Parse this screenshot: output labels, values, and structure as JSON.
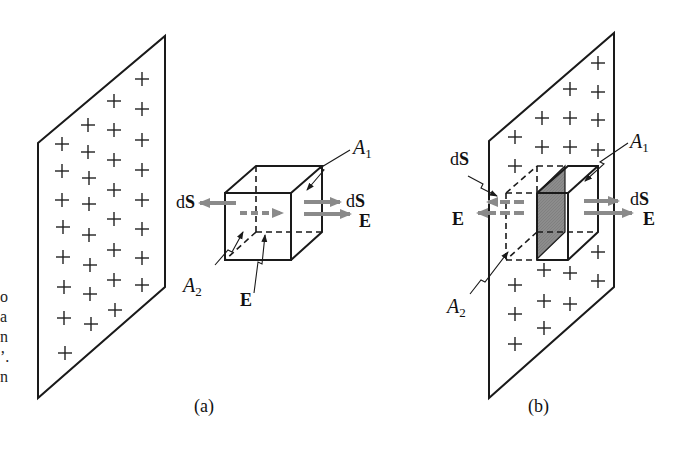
{
  "figure": {
    "left_caption_fragments": [
      "o",
      "a",
      "n",
      "’.",
      "n"
    ],
    "panels": [
      {
        "id": "a",
        "label": "(a)",
        "plate_charge_sign": "+",
        "labels": {
          "dS_left": "dS",
          "dS_right": "dS",
          "E_right": "E",
          "E_bottom": "E",
          "A1": "A",
          "A1_sub": "1",
          "A2": "A",
          "A2_sub": "2"
        }
      },
      {
        "id": "b",
        "label": "(b)",
        "plate_charge_sign": "+",
        "labels": {
          "dS_left": "dS",
          "dS_right": "dS",
          "E_left": "E",
          "E_right": "E",
          "A1": "A",
          "A1_sub": "1",
          "A2": "A",
          "A2_sub": "2"
        }
      }
    ],
    "colors": {
      "line": "#1a1a1a",
      "arrow": "#8a8a8a",
      "shaded_face": "#8c8c8c",
      "background": "#ffffff"
    }
  }
}
